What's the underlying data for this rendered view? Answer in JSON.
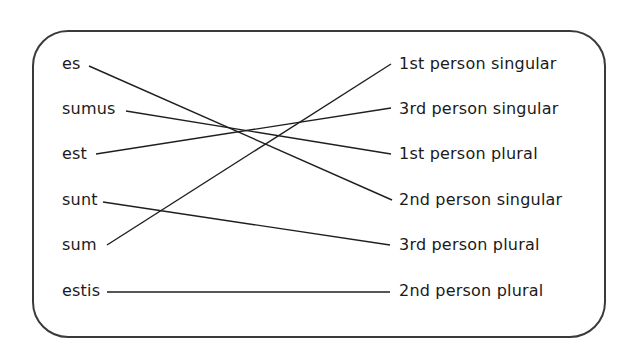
{
  "left_items": [
    {
      "id": "es",
      "label": "es",
      "y": 64,
      "line_start": [
        89,
        66
      ]
    },
    {
      "id": "sumus",
      "label": "sumus",
      "y": 109,
      "line_start": [
        126,
        111
      ]
    },
    {
      "id": "est",
      "label": "est",
      "y": 154,
      "line_start": [
        96,
        154
      ]
    },
    {
      "id": "sunt",
      "label": "sunt",
      "y": 200,
      "line_start": [
        103,
        202
      ]
    },
    {
      "id": "sum",
      "label": "sum",
      "y": 245,
      "line_start": [
        107,
        245
      ]
    },
    {
      "id": "estis",
      "label": "estis",
      "y": 291,
      "line_start": [
        107,
        292
      ]
    }
  ],
  "right_items": [
    {
      "id": "1sg",
      "label": "1st person singular",
      "y": 64,
      "line_end": [
        391,
        64
      ]
    },
    {
      "id": "3sg",
      "label": "3rd person singular",
      "y": 109,
      "line_end": [
        391,
        108
      ]
    },
    {
      "id": "1pl",
      "label": "1st person plural",
      "y": 154,
      "line_end": [
        391,
        154
      ]
    },
    {
      "id": "2sg",
      "label": "2nd person singular",
      "y": 200,
      "line_end": [
        392,
        200
      ]
    },
    {
      "id": "3pl",
      "label": "3rd person plural",
      "y": 245,
      "line_end": [
        390,
        245
      ]
    },
    {
      "id": "2pl",
      "label": "2nd person plural",
      "y": 291,
      "line_end": [
        390,
        292
      ]
    }
  ],
  "matches": [
    {
      "from": "es",
      "to": "2sg"
    },
    {
      "from": "sumus",
      "to": "1pl"
    },
    {
      "from": "est",
      "to": "3sg"
    },
    {
      "from": "sunt",
      "to": "3pl"
    },
    {
      "from": "sum",
      "to": "1sg"
    },
    {
      "from": "estis",
      "to": "2pl"
    }
  ],
  "colors": {
    "line": "#1f1f1f",
    "border": "#3a3a3a",
    "text": "#1a1a1a",
    "background": "#ffffff"
  }
}
